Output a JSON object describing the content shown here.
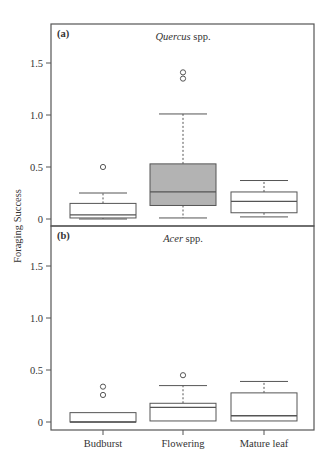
{
  "figure": {
    "ylabel": "Foraging Success",
    "categories": [
      "Budburst",
      "Flowering",
      "Mature leaf"
    ],
    "colors": {
      "axis": "#555555",
      "box_default": "#ffffff",
      "box_highlight": "#b3b3b3",
      "stroke": "#555555"
    }
  },
  "chart_data": [
    {
      "type": "box",
      "panel": "(a)",
      "title_italic": "Quercus",
      "title_rest": " spp.",
      "xlabel": "",
      "ylabel": "Foraging Success",
      "ylim": [
        0,
        1.75
      ],
      "yticks": [
        0,
        0.5,
        1.0,
        1.5
      ],
      "ytick_labels": [
        "0",
        "0.5",
        "1.0",
        "1.5"
      ],
      "categories": [
        "Budburst",
        "Flowering",
        "Mature leaf"
      ],
      "series": [
        {
          "name": "Budburst",
          "min": 0.0,
          "q1": 0.01,
          "median": 0.04,
          "q3": 0.15,
          "max": 0.25,
          "outliers": [
            0.5
          ],
          "fill": "#ffffff"
        },
        {
          "name": "Flowering",
          "min": 0.01,
          "q1": 0.13,
          "median": 0.26,
          "q3": 0.53,
          "max": 1.01,
          "outliers": [
            1.35,
            1.41
          ],
          "fill": "#b3b3b3"
        },
        {
          "name": "Mature leaf",
          "min": 0.02,
          "q1": 0.06,
          "median": 0.17,
          "q3": 0.26,
          "max": 0.37,
          "outliers": [],
          "fill": "#ffffff"
        }
      ]
    },
    {
      "type": "box",
      "panel": "(b)",
      "title_italic": "Acer",
      "title_rest": " spp.",
      "xlabel": "",
      "ylabel": "Foraging Success",
      "ylim": [
        0,
        1.75
      ],
      "yticks": [
        0,
        0.5,
        1.0,
        1.5
      ],
      "ytick_labels": [
        "0",
        "0.5",
        "1.0",
        "1.5"
      ],
      "categories": [
        "Budburst",
        "Flowering",
        "Mature leaf"
      ],
      "series": [
        {
          "name": "Budburst",
          "min": 0.0,
          "q1": 0.0,
          "median": 0.0,
          "q3": 0.09,
          "max": 0.09,
          "outliers": [
            0.26,
            0.34
          ],
          "fill": "#ffffff"
        },
        {
          "name": "Flowering",
          "min": 0.01,
          "q1": 0.01,
          "median": 0.14,
          "q3": 0.18,
          "max": 0.35,
          "outliers": [
            0.45
          ],
          "fill": "#ffffff"
        },
        {
          "name": "Mature leaf",
          "min": 0.01,
          "q1": 0.01,
          "median": 0.06,
          "q3": 0.28,
          "max": 0.39,
          "outliers": [],
          "fill": "#ffffff"
        }
      ]
    }
  ]
}
